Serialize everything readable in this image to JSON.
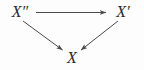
{
  "diagram": {
    "type": "commutative-triangle",
    "background_color": "#fdfdfd",
    "stroke_color": "#4a4a4a",
    "text_color": "#2b2b2b",
    "nodes": [
      {
        "id": "x-double-prime",
        "label": "X″",
        "x": 20,
        "y": 12
      },
      {
        "id": "x-prime",
        "label": "X′",
        "x": 123,
        "y": 12
      },
      {
        "id": "x",
        "label": "X",
        "x": 72,
        "y": 58
      }
    ],
    "arrows": [
      {
        "id": "arrow-xpp-to-xp",
        "from": "x-double-prime",
        "to": "x-prime",
        "label": "",
        "direction": "right"
      },
      {
        "id": "arrow-xpp-to-x",
        "from": "x-double-prime",
        "to": "x",
        "label": "",
        "direction": "down-right"
      },
      {
        "id": "arrow-xp-to-x",
        "from": "x-prime",
        "to": "x",
        "label": "",
        "direction": "down-left"
      }
    ]
  }
}
